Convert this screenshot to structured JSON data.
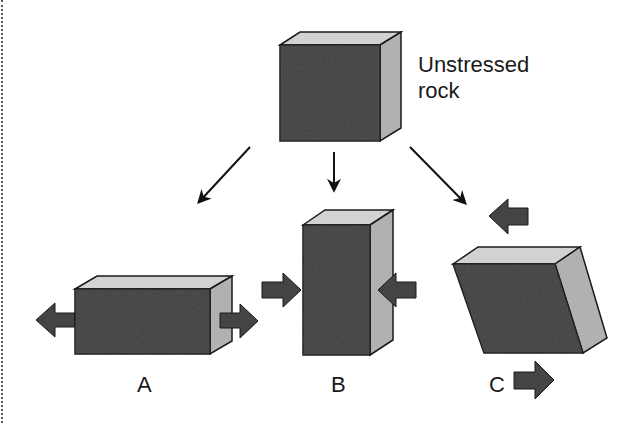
{
  "diagram": {
    "title_label": {
      "line1": "Unstressed",
      "line2": "rock"
    },
    "panels": [
      {
        "id": "A",
        "label": "A",
        "stress": "tension"
      },
      {
        "id": "B",
        "label": "B",
        "stress": "compression"
      },
      {
        "id": "C",
        "label": "C",
        "stress": "shear"
      }
    ],
    "colors": {
      "front_face": "#3e3e3e",
      "top_face": "#d2d2d2",
      "side_face": "#b1b1b1",
      "outline": "#1a1a1a",
      "arrow_fill": "#444444",
      "pointer": "#111111"
    }
  }
}
